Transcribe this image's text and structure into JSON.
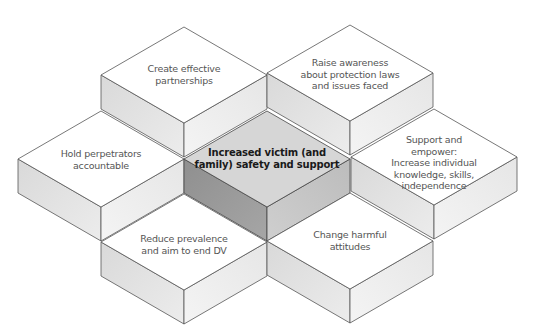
{
  "diagram": {
    "type": "isometric-hexagonal-block-cluster",
    "center": {
      "label": "Increased victim (and\nfamily) safety and support",
      "emphasis": true,
      "colors": {
        "top": "#d6d6d6",
        "left": "#999999",
        "right": "#c4c4c4"
      }
    },
    "blocks": [
      {
        "id": "top-left",
        "label": "Create effective\npartnerships"
      },
      {
        "id": "top-right",
        "label": "Raise awareness\nabout protection laws\nand issues faced"
      },
      {
        "id": "left",
        "label": "Hold perpetrators\naccountable"
      },
      {
        "id": "right",
        "label": "Support and empower:\nIncrease individual\nknowledge, skills,\nindependence"
      },
      {
        "id": "bottom-left",
        "label": "Reduce prevalence\nand aim to end DV"
      },
      {
        "id": "bottom-right",
        "label": "Change harmful\nattitudes"
      }
    ],
    "colors": {
      "top": "#ffffff",
      "left": "#e0e0e0",
      "right": "#f2f2f2",
      "stroke": "#555555",
      "text": "#555555"
    }
  }
}
